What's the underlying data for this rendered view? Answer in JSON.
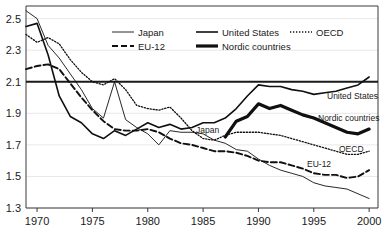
{
  "chart_data": {
    "type": "line",
    "title": "",
    "subtitle": "",
    "xlabel": "",
    "ylabel": "",
    "xlim": [
      1969,
      2000.8
    ],
    "ylim": [
      1.3,
      2.58
    ],
    "grid": true,
    "legend_position": "top-center",
    "x_ticks": [
      1970,
      1975,
      1980,
      1985,
      1990,
      1995,
      2000
    ],
    "x_tick_labels": [
      "1970",
      "1975",
      "1980",
      "1985",
      "1990",
      "1995",
      "2000"
    ],
    "y_ticks": [
      1.3,
      1.5,
      1.7,
      1.9,
      2.1,
      2.3,
      2.5
    ],
    "y_tick_labels": [
      "1.3",
      "1.5",
      "1.7",
      "1.9",
      "2.1",
      "2.3",
      "2.5"
    ],
    "reference_line": {
      "value": 2.1,
      "label": "2.1"
    },
    "series": [
      {
        "name": "Japan",
        "style": "thin-solid",
        "inline_label": "Japan",
        "x": [
          1969,
          1970,
          1971,
          1972,
          1973,
          1974,
          1975,
          1976,
          1977,
          1978,
          1979,
          1980,
          1981,
          1982,
          1983,
          1984,
          1985,
          1986,
          1987,
          1988,
          1989,
          1990,
          1991,
          1992,
          1993,
          1994,
          1995,
          1996,
          1997,
          1998,
          1999,
          2000
        ],
        "values": [
          2.55,
          2.5,
          2.33,
          2.25,
          2.15,
          2.05,
          1.93,
          1.87,
          2.1,
          1.86,
          1.81,
          1.77,
          1.7,
          1.79,
          1.78,
          1.78,
          1.77,
          1.73,
          1.71,
          1.67,
          1.66,
          1.61,
          1.57,
          1.54,
          1.52,
          1.5,
          1.46,
          1.44,
          1.43,
          1.42,
          1.39,
          1.36
        ],
        "end_value": 1.36
      },
      {
        "name": "EU-12",
        "style": "dashed",
        "inline_label": "EU-12",
        "x": [
          1969,
          1970,
          1971,
          1972,
          1973,
          1974,
          1975,
          1976,
          1977,
          1978,
          1979,
          1980,
          1981,
          1982,
          1983,
          1984,
          1985,
          1986,
          1987,
          1988,
          1989,
          1990,
          1991,
          1992,
          1993,
          1994,
          1995,
          1996,
          1997,
          1998,
          1999,
          2000
        ],
        "values": [
          2.18,
          2.2,
          2.21,
          2.18,
          2.09,
          2.0,
          1.92,
          1.85,
          1.8,
          1.79,
          1.79,
          1.8,
          1.78,
          1.74,
          1.71,
          1.7,
          1.68,
          1.66,
          1.66,
          1.65,
          1.63,
          1.6,
          1.59,
          1.59,
          1.57,
          1.55,
          1.52,
          1.51,
          1.51,
          1.49,
          1.5,
          1.54
        ],
        "end_value": 1.54
      },
      {
        "name": "United States",
        "style": "medium-solid",
        "inline_label": "United States",
        "x": [
          1969,
          1970,
          1971,
          1972,
          1973,
          1974,
          1975,
          1976,
          1977,
          1978,
          1979,
          1980,
          1981,
          1982,
          1983,
          1984,
          1985,
          1986,
          1987,
          1988,
          1989,
          1990,
          1991,
          1992,
          1993,
          1994,
          1995,
          1996,
          1997,
          1998,
          1999,
          2000
        ],
        "values": [
          2.45,
          2.47,
          2.27,
          2.01,
          1.88,
          1.84,
          1.77,
          1.74,
          1.79,
          1.76,
          1.8,
          1.84,
          1.81,
          1.83,
          1.8,
          1.81,
          1.84,
          1.84,
          1.87,
          1.93,
          2.01,
          2.08,
          2.07,
          2.07,
          2.05,
          2.04,
          2.02,
          2.03,
          2.04,
          2.06,
          2.08,
          2.13
        ],
        "end_value": 2.13
      },
      {
        "name": "Nordic countries",
        "style": "thick-solid",
        "inline_label": "Nordic countries",
        "x": [
          1987,
          1988,
          1989,
          1990,
          1991,
          1992,
          1993,
          1994,
          1995,
          1996,
          1997,
          1998,
          1999,
          2000
        ],
        "values": [
          1.75,
          1.85,
          1.88,
          1.96,
          1.93,
          1.95,
          1.92,
          1.89,
          1.87,
          1.84,
          1.81,
          1.78,
          1.77,
          1.8
        ],
        "end_value": 1.8
      },
      {
        "name": "OECD",
        "style": "dotted",
        "inline_label": "OECD",
        "x": [
          1969,
          1970,
          1971,
          1972,
          1973,
          1974,
          1975,
          1976,
          1977,
          1978,
          1979,
          1980,
          1981,
          1982,
          1983,
          1984,
          1985,
          1986,
          1987,
          1988,
          1989,
          1990,
          1991,
          1992,
          1993,
          1994,
          1995,
          1996,
          1997,
          1998,
          1999,
          2000
        ],
        "values": [
          2.4,
          2.35,
          2.38,
          2.34,
          2.24,
          2.16,
          2.1,
          2.08,
          2.12,
          2.05,
          1.95,
          1.93,
          1.92,
          1.94,
          1.87,
          1.79,
          1.74,
          1.73,
          1.76,
          1.78,
          1.78,
          1.78,
          1.77,
          1.76,
          1.74,
          1.72,
          1.7,
          1.68,
          1.66,
          1.64,
          1.64,
          1.66
        ],
        "end_value": 1.66
      }
    ]
  },
  "legend": {
    "entries": [
      {
        "label": "Japan",
        "style": "thin-solid"
      },
      {
        "label": "United States",
        "style": "medium-solid"
      },
      {
        "label": "OECD",
        "style": "dotted"
      },
      {
        "label": "EU-12",
        "style": "dashed"
      },
      {
        "label": "Nordic countries",
        "style": "thick-solid"
      }
    ]
  },
  "inline_labels": [
    {
      "name": "japan",
      "text": "Japan"
    },
    {
      "name": "united-states",
      "text": "United States"
    },
    {
      "name": "nordic-countries",
      "text": "Nordic countries"
    },
    {
      "name": "oecd",
      "text": "OECD"
    },
    {
      "name": "eu-12",
      "text": "EU-12"
    }
  ],
  "colors": {
    "line": "#101010",
    "grid": "#e2e2e2",
    "frame": "#3a3a3a",
    "background": "#ffffff"
  }
}
